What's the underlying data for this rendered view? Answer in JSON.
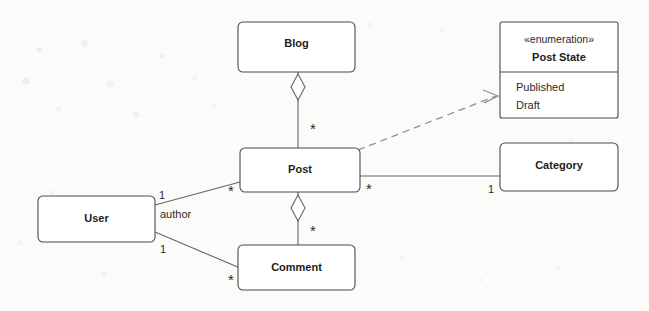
{
  "diagram": {
    "type": "uml-class-diagram",
    "stroke_color": "#4b4b4b",
    "line_color": "#666666",
    "dashed_line_color": "#8f8f8f",
    "background_color": "#fbfbf9"
  },
  "classes": {
    "blog": {
      "name": "Blog"
    },
    "post": {
      "name": "Post"
    },
    "comment": {
      "name": "Comment"
    },
    "user": {
      "name": "User"
    },
    "category": {
      "name": "Category"
    },
    "post_state": {
      "stereotype": "«enumeration»",
      "name": "Post State",
      "literals": [
        "Published",
        "Draft"
      ]
    }
  },
  "relationships": [
    {
      "id": "blog-post",
      "kind": "aggregation",
      "from": "Blog",
      "to": "Post",
      "source_multiplicity": "",
      "target_multiplicity": "*"
    },
    {
      "id": "post-comment",
      "kind": "aggregation",
      "from": "Post",
      "to": "Comment",
      "source_multiplicity": "",
      "target_multiplicity": "*"
    },
    {
      "id": "post-category",
      "kind": "association",
      "from": "Post",
      "to": "Category",
      "source_multiplicity": "*",
      "target_multiplicity": "1"
    },
    {
      "id": "user-post",
      "kind": "association",
      "from": "User",
      "to": "Post",
      "source_multiplicity": "1",
      "target_multiplicity": "*",
      "role_label": "author"
    },
    {
      "id": "user-comment",
      "kind": "association",
      "from": "User",
      "to": "Comment",
      "source_multiplicity": "1",
      "target_multiplicity": "*"
    },
    {
      "id": "post-poststate",
      "kind": "dependency",
      "from": "Post",
      "to": "Post State"
    }
  ],
  "labels": {
    "mult_blog_post_star": "*",
    "mult_post_comment_star": "*",
    "mult_post_category_star": "*",
    "mult_category_one": "1",
    "mult_user_post_one": "1",
    "mult_user_post_star": "*",
    "mult_user_comment_one": "1",
    "mult_user_comment_star": "*",
    "role_author": "author"
  }
}
